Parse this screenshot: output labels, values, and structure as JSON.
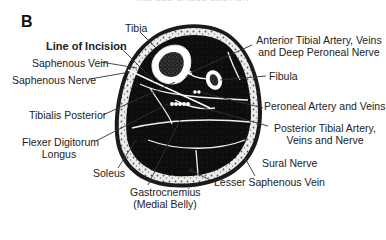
{
  "figure": {
    "top_caption": "MID-LEG CROSS-SECTION",
    "panel_letter": "B"
  },
  "labels": {
    "tibia": "Tibia",
    "line_of_incision": "Line of Incision",
    "saphenous_vein": "Saphenous Vein",
    "saphenous_nerve": "Saphenous Nerve",
    "tibialis_posterior": "Tibialis Posterior",
    "flexor_digitorum_line1": "Flexer Digitorum",
    "flexor_digitorum_line2": "Longus",
    "soleus": "Soleus",
    "gastrocnemius_line1": "Gastrocnemius",
    "gastrocnemius_line2": "(Medial Belly)",
    "lesser_saphenous_vein": "Lesser Saphenous Vein",
    "sural_nerve": "Sural Nerve",
    "posterior_tibial_line1": "Posterior Tibial Artery,",
    "posterior_tibial_line2": "Veins and Nerve",
    "peroneal_artery": "Peroneal Artery and Veins",
    "fibula": "Fibula",
    "anterior_tibial_line1": "Anterior Tibial Artery, Veins",
    "anterior_tibial_line2": "and Deep Peroneal Nerve"
  },
  "colors": {
    "muscle": "#111111",
    "fat": "#e8e8e8",
    "skin": "#1a1a1a",
    "bone_cortex": "#ffffff",
    "marrow": "#2a2a2a",
    "leader": "#333333"
  }
}
